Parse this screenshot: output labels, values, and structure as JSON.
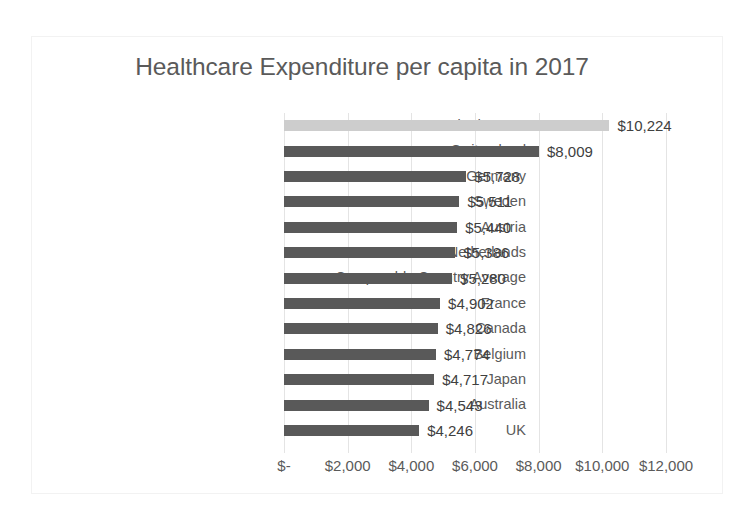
{
  "chart_data": {
    "type": "bar",
    "orientation": "horizontal",
    "title": "Healthcare Expenditure per capita in 2017",
    "xlabel": "",
    "ylabel": "",
    "xlim": [
      0,
      12000
    ],
    "grid": true,
    "legend": false,
    "value_prefix": "$",
    "highlight_category": "United States",
    "colors": {
      "bar": "#595959",
      "highlight_bar": "#cdcdcd",
      "title_text": "#5a5a5a",
      "label_text": "#5a5a5a",
      "value_text": "#404040",
      "gridline": "#e4e4e4",
      "frame_border": "#f2f2f2",
      "background": "#ffffff"
    },
    "categories": [
      "United States",
      "Switzerland",
      "Germany",
      "Sweden",
      "Austria",
      "Netherlands",
      "Comparable Country Average",
      "France",
      "Canada",
      "Belgium",
      "Japan",
      "Australia",
      "UK"
    ],
    "values": [
      10224,
      8009,
      5728,
      5511,
      5440,
      5386,
      5280,
      4902,
      4826,
      4774,
      4717,
      4543,
      4246
    ],
    "value_labels": [
      "$10,224",
      "$8,009",
      "$5,728",
      "$5,511",
      "$5,440",
      "$5,386",
      "$5,280",
      "$4,902",
      "$4,826",
      "$4,774",
      "$4,717",
      "$4,543",
      "$4,246"
    ],
    "xticks": [
      0,
      2000,
      4000,
      6000,
      8000,
      10000,
      12000
    ],
    "xticklabels": [
      "$-",
      "$2,000",
      "$4,000",
      "$6,000",
      "$8,000",
      "$10,000",
      "$12,000"
    ]
  }
}
